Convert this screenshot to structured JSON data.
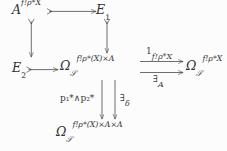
{
  "diagram": {
    "type": "commutative-diagram",
    "caption": "",
    "nodes": {
      "top_left": {
        "id": "n-A",
        "latex": "A^{f_!\\rho^*X}",
        "base": "A",
        "sup": "f!ρ*X"
      },
      "top_right": {
        "id": "n-E1",
        "base": "E",
        "sub": "1",
        "latex": "E_1"
      },
      "mid_left": {
        "id": "n-E2",
        "base": "E",
        "sub": "2",
        "latex": "E_2"
      },
      "mid_center": {
        "id": "n-Omega-XA",
        "base": "Ω",
        "sub": "𝒮",
        "sup": "f!ρ*(X)×A",
        "latex": "\\Omega_{\\mathscr{S}}^{f_!\\rho^*(X)\\times A}"
      },
      "mid_right": {
        "id": "n-Omega-X",
        "base": "Ω",
        "sub": "𝒮",
        "sup": "f!ρ*X",
        "latex": "\\Omega_{\\mathscr{S}}^{f_!\\rho^*X}"
      },
      "bottom": {
        "id": "n-Omega-XAA",
        "base": "Ω",
        "sub": "𝒮",
        "sup": "f!ρ*(X)×A×A",
        "latex": "\\Omega_{\\mathscr{S}}^{f_!\\rho^*(X)\\times A\\times A}"
      }
    },
    "edge_labels": {
      "top_parallel": {
        "base": "1",
        "sub": "f!ρ*X",
        "latex": "1_{f_!\\rho^*X}"
      },
      "bottom_parallel": {
        "base": "∃",
        "sub": "A",
        "latex": "\\exists_A"
      },
      "vert_left": {
        "text": "p₁*∧p₂*",
        "latex": "p_1^*\\wedge p_2^*"
      },
      "vert_right": {
        "base": "∃",
        "sub": "δ",
        "latex": "\\exists_\\delta"
      }
    },
    "edges": [
      {
        "name": "A-to-E1",
        "from": "top_left",
        "to": "top_right",
        "kind": "monomorphism",
        "dir": "right",
        "label": ""
      },
      {
        "name": "A-to-E2",
        "from": "top_left",
        "to": "mid_left",
        "kind": "monomorphism",
        "dir": "down",
        "label": ""
      },
      {
        "name": "E1-to-OmegaXA",
        "from": "top_right",
        "to": "mid_center",
        "kind": "monomorphism",
        "dir": "down",
        "label": ""
      },
      {
        "name": "E2-to-OmegaXA",
        "from": "mid_left",
        "to": "mid_center",
        "kind": "monomorphism",
        "dir": "right",
        "label": ""
      },
      {
        "name": "OmegaXA-to-OmegaX-identity",
        "from": "mid_center",
        "to": "mid_right",
        "kind": "arrow",
        "dir": "right",
        "label": "top_parallel"
      },
      {
        "name": "OmegaXA-to-OmegaX-exists-A",
        "from": "mid_center",
        "to": "mid_right",
        "kind": "arrow",
        "dir": "right",
        "label": "bottom_parallel"
      },
      {
        "name": "OmegaXA-to-OmegaXAA-meet",
        "from": "mid_center",
        "to": "bottom",
        "kind": "arrow",
        "dir": "down",
        "label": "vert_left"
      },
      {
        "name": "OmegaXA-to-OmegaXAA-exists-delta",
        "from": "mid_center",
        "to": "bottom",
        "kind": "arrow",
        "dir": "down",
        "label": "vert_right"
      }
    ],
    "colors": {
      "background": "#fcfcfc",
      "ink": "#30302f",
      "stroke": "#4a4a48"
    }
  }
}
